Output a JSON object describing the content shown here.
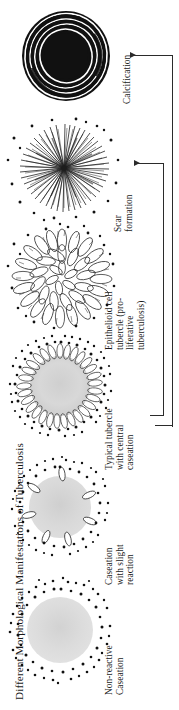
{
  "figure": {
    "title": "Different Morphological Manifestations of Tuberculosis",
    "orientation": "vertical-rotated-labels",
    "ink_color": "#1a1a1a",
    "background_color": "#ffffff",
    "caseum_color": "#d8d8d8"
  },
  "stages": [
    {
      "id": "calcification",
      "label": "Calcification",
      "lines": [
        "Calcification"
      ],
      "art": "concentric-black-calcified-nodule"
    },
    {
      "id": "scar-formation",
      "label": "Scar formation",
      "lines": [
        "Scar",
        "formation"
      ],
      "art": "radiating-fibrous-scar-starburst"
    },
    {
      "id": "epithelioid-cell-tubercle",
      "label": "Epithelioid cell tubercle (pro-liferative tuberculosis)",
      "lines": [
        "Epithelioid cell",
        "tubercle (pro-",
        "liferative tuberculosis)"
      ],
      "art": "radial-epithelioid-cell-rosette"
    },
    {
      "id": "typical-tubercle",
      "label": "Typical tubercle with central caseation",
      "lines": [
        "Typical tubercle",
        "with central",
        "caseation"
      ],
      "art": "caseous-center-with-epithelioid-palisade"
    },
    {
      "id": "caseation-slight-reaction",
      "label": "Caseation with slight reaction",
      "lines": [
        "Caseation",
        "with slight",
        "reaction"
      ],
      "art": "caseous-mass-with-sparse-giant-cells"
    },
    {
      "id": "non-reactive-caseation",
      "label": "Non-reactive Caseation",
      "lines": [
        "Non-reactive",
        "Caseation"
      ],
      "art": "pale-caseous-mass-with-scattered-bacilli"
    }
  ],
  "connectors": [
    {
      "id": "calcification-arrow",
      "from": "outer-spine",
      "to": "calcification"
    },
    {
      "id": "scar-formation-arrow",
      "from": "inner-spine",
      "to": "scar-formation"
    }
  ]
}
